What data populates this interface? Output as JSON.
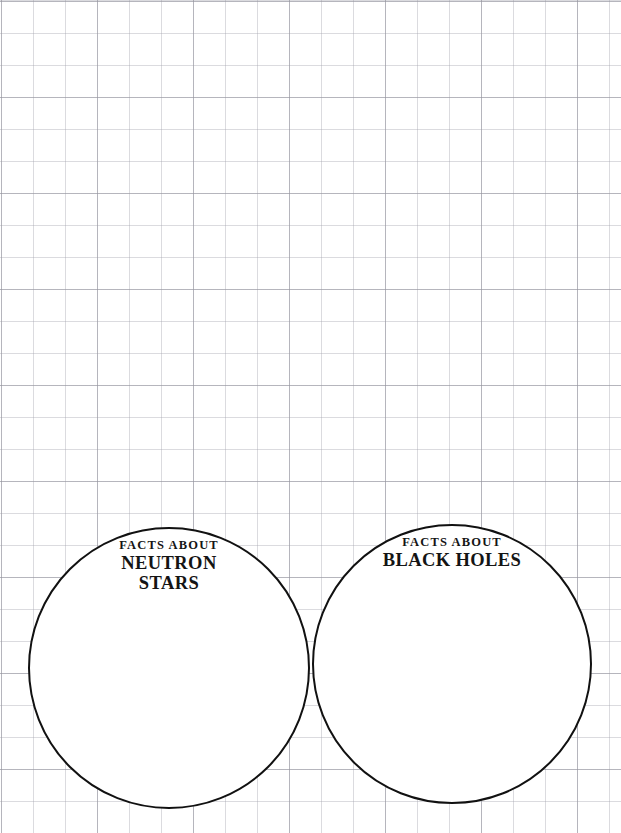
{
  "page": {
    "background_style": "graph-paper-grid",
    "grid_color": "#a6a6b0",
    "page_background": "#ffffff",
    "width": 621,
    "height": 833
  },
  "diagram": {
    "type": "venn-two-circle",
    "stroke_color": "#111111",
    "fill_color": "#ffffff",
    "circles": [
      {
        "id": "left",
        "eyebrow": "FACTS ABOUT",
        "title_lines": [
          "NEUTRON",
          "STARS"
        ],
        "center_x": 169,
        "center_y": 668,
        "radius": 141
      },
      {
        "id": "right",
        "eyebrow": "FACTS ABOUT",
        "title_lines": [
          "BLACK HOLES"
        ],
        "center_x": 452,
        "center_y": 664,
        "radius": 140
      }
    ]
  }
}
